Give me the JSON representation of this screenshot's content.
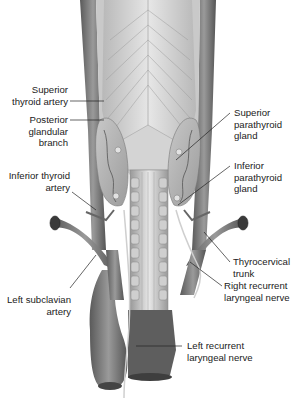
{
  "figure": {
    "colors": {
      "background": "#ffffff",
      "tissue_light": "#d9d9d9",
      "tissue_mid": "#a8a8a8",
      "vessel": "#6e6e6e",
      "line": "#333333"
    }
  },
  "labels": {
    "superior_thyroid_artery": {
      "line1": "Superior",
      "line2": "thyroid artery"
    },
    "posterior_glandular_branch": {
      "line1": "Posterior",
      "line2": "glandular",
      "line3": "branch"
    },
    "inferior_thyroid_artery": {
      "line1": "Inferior thyroid",
      "line2": "artery"
    },
    "left_subclavian_artery": {
      "line1": "Left subclavian",
      "line2": "artery"
    },
    "superior_parathyroid_gland": {
      "line1": "Superior",
      "line2": "parathyroid",
      "line3": "gland"
    },
    "inferior_parathyroid_gland": {
      "line1": "Inferior",
      "line2": "parathyroid",
      "line3": "gland"
    },
    "thyrocervical_trunk": {
      "line1": "Thyrocervical",
      "line2": "trunk"
    },
    "right_recurrent_laryngeal_nerve": {
      "line1": "Right recurrent",
      "line2": "laryngeal nerve"
    },
    "left_recurrent_laryngeal_nerve": {
      "line1": "Left recurrent",
      "line2": "laryngeal nerve"
    }
  }
}
